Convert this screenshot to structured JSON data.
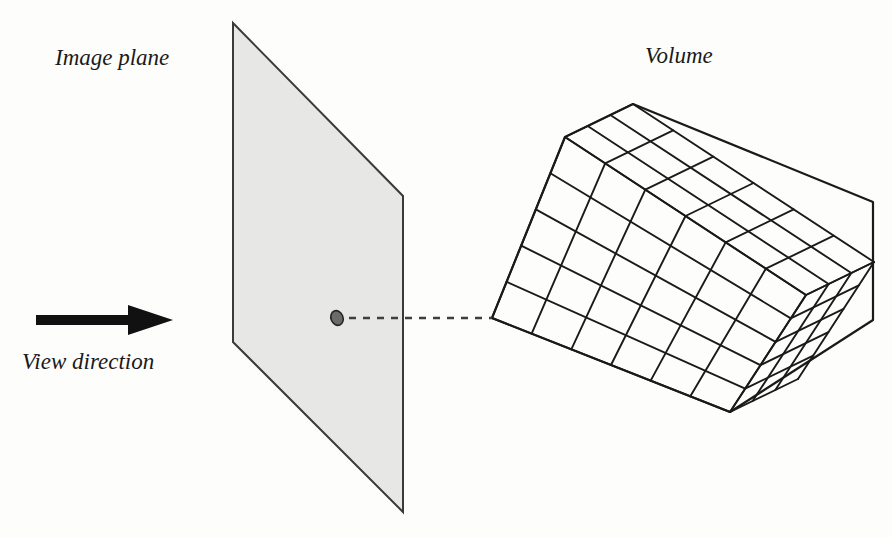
{
  "figure": {
    "background_color": "#fdfdfc",
    "ink_color": "#1a1a1a",
    "labels": {
      "image_plane": "Image plane",
      "volume": "Volume",
      "view_direction": "View direction"
    },
    "image_plane": {
      "name": "image-plane",
      "fill_color": "#e7e7e5",
      "stroke_color": "#3a3a3a",
      "points": "233,23 403,196 403,512 233,342"
    },
    "pixel_marker": {
      "name": "pixel-sample-point",
      "fill_color": "#6b6b6b",
      "stroke_color": "#262626",
      "cx": 337,
      "cy": 318,
      "rx": 6,
      "ry": 7.5,
      "rotation": -22
    },
    "ray": {
      "name": "view-ray",
      "style": "dashed",
      "stroke_color": "#3f3f3f",
      "dash_pattern": "7 7",
      "x1": 349,
      "y1": 318,
      "x2": 492,
      "y2": 318
    },
    "view_arrow": {
      "name": "view-direction-arrow",
      "fill_color": "#111111",
      "shaft_x1": 36,
      "shaft_x2": 131,
      "shaft_y": 320,
      "shaft_half_height": 5,
      "head_back_x": 128,
      "head_tip_x": 173,
      "head_half_height": 15
    },
    "volume": {
      "name": "volume-box",
      "stroke_color": "#1a1a1a",
      "fill_color": "#ffffff",
      "grid": {
        "cols": 6,
        "rows": 5,
        "depth": 3
      },
      "corners": {
        "front_top_left": [
          565,
          137
        ],
        "front_top_right": [
          806,
          295
        ],
        "front_bottom_right": [
          730,
          412
        ],
        "front_bottom_left": [
          492,
          318
        ],
        "back_top_left": [
          633,
          104
        ],
        "back_top_right": [
          873,
          202
        ],
        "back_bottom_right": [
          873,
          320
        ]
      }
    },
    "label_positions": {
      "image_plane": {
        "x": 55,
        "y": 65
      },
      "volume": {
        "x": 645,
        "y": 63
      },
      "view_direction": {
        "x": 22,
        "y": 369
      }
    }
  }
}
